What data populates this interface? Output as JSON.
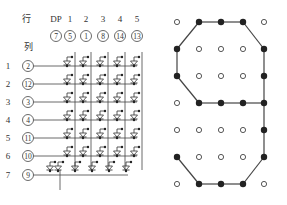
{
  "matrix": {
    "row_header": "行",
    "col_header": "列",
    "column_labels": [
      "DP",
      "1",
      "2",
      "3",
      "4",
      "5"
    ],
    "column_pins": [
      "7",
      "5",
      "1",
      "8",
      "14",
      "13"
    ],
    "row_labels": [
      "1",
      "2",
      "3",
      "4",
      "5",
      "6",
      "7"
    ],
    "row_pins": [
      "2",
      "12",
      "3",
      "4",
      "11",
      "10",
      "9"
    ]
  },
  "dot_display": {
    "rows": 7,
    "cols": 5,
    "lit": [
      [
        0,
        1,
        1,
        1,
        0
      ],
      [
        1,
        0,
        0,
        0,
        1
      ],
      [
        1,
        0,
        0,
        0,
        1
      ],
      [
        0,
        1,
        1,
        1,
        1
      ],
      [
        0,
        0,
        0,
        0,
        1
      ],
      [
        1,
        0,
        0,
        0,
        1
      ],
      [
        0,
        1,
        1,
        1,
        0
      ]
    ],
    "character": "9",
    "colors": {
      "on": "#222222",
      "off_stroke": "#444444",
      "line": "#444444"
    }
  }
}
